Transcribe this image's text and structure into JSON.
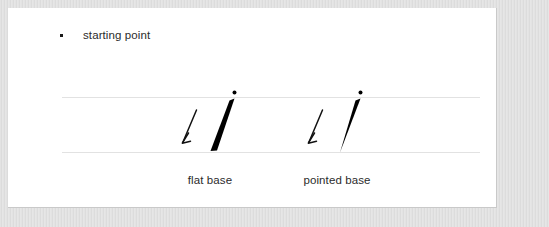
{
  "card": {
    "bullet": {
      "marker": "square-bullet",
      "label": "starting point"
    },
    "guide_lines": {
      "top_line_label": "top-guide-line",
      "baseline_label": "baseline-guide-line"
    },
    "strokes": [
      {
        "id": "flat-base",
        "caption": "flat base",
        "start_dot": "starting-point-dot",
        "arrow": "stroke-direction-arrow",
        "base_style": "flat"
      },
      {
        "id": "pointed-base",
        "caption": "pointed base",
        "start_dot": "starting-point-dot",
        "arrow": "stroke-direction-arrow",
        "base_style": "pointed"
      }
    ]
  },
  "colors": {
    "ink": "#000000",
    "text": "#2b2b2b",
    "rule": "#e2e2e2",
    "frame": "#e3e3e3",
    "card": "#ffffff"
  }
}
